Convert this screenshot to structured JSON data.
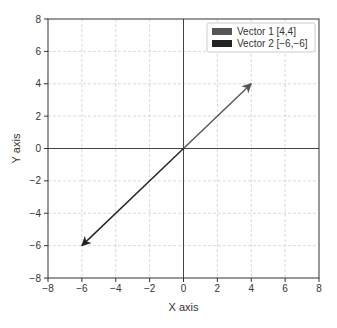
{
  "chart_data": {
    "type": "vector",
    "title": "",
    "xlabel": "X axis",
    "ylabel": "Y axis",
    "xlim": [
      -8,
      8
    ],
    "ylim": [
      -8,
      8
    ],
    "xticks": [
      -8,
      -6,
      -4,
      -2,
      0,
      2,
      4,
      6,
      8
    ],
    "yticks": [
      -8,
      -6,
      -4,
      -2,
      0,
      2,
      4,
      6,
      8
    ],
    "xtick_labels": [
      "−8",
      "−6",
      "−4",
      "−2",
      "0",
      "2",
      "4",
      "6",
      "8"
    ],
    "ytick_labels": [
      "−8",
      "−6",
      "−4",
      "−2",
      "0",
      "2",
      "4",
      "6",
      "8"
    ],
    "grid": true,
    "grid_style": "dashed",
    "axes_through_origin": true,
    "legend_position": "upper right",
    "series": [
      {
        "name": "Vector 1 [4,4]",
        "origin": [
          0,
          0
        ],
        "vector": [
          4,
          4
        ],
        "color": "#555555"
      },
      {
        "name": "Vector 2 [−6,−6]",
        "origin": [
          0,
          0
        ],
        "vector": [
          -6,
          -6
        ],
        "color": "#222222"
      }
    ]
  },
  "legend": {
    "items": [
      {
        "label": "Vector 1 [4,4]",
        "color": "#555555"
      },
      {
        "label": "Vector 2 [−6,−6]",
        "color": "#222222"
      }
    ]
  },
  "axes": {
    "xlabel": "X axis",
    "ylabel": "Y axis"
  }
}
